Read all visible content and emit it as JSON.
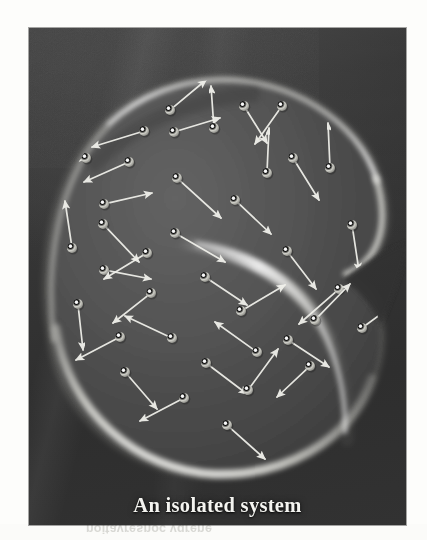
{
  "figure": {
    "caption": "An isolated system",
    "panel": {
      "background_color": "#383838",
      "border_color": "#1d1d1d",
      "page_color": "#fdfdfb"
    },
    "blob": {
      "label": "isolated-system-boundary",
      "shape": "kidney-bean",
      "fill_color": "#4f4f4f",
      "rim_light_color": "#e9e9e4",
      "description": "A large rounded kidney-bean shaped container with a glowing rim and an internal fold on the right side"
    },
    "particles": {
      "label": "gas-molecules",
      "color": "#e2e2dc",
      "count": 38,
      "arrow_color": "#f0f0ea",
      "arrow_label": "velocity-vector"
    },
    "bleed_text": "noitavresnoc ygrene"
  },
  "chart_data": {
    "type": "scatter",
    "title": "An isolated system",
    "xlabel": "",
    "ylabel": "",
    "xlim": [
      0,
      377
    ],
    "ylim": [
      0,
      497
    ],
    "grid": false,
    "legend": null,
    "annotations": [
      "An isolated system"
    ],
    "series": [
      {
        "name": "gas-molecules",
        "marker": "sphere",
        "color": "#e2e2dc",
        "points": [
          {
            "x": 141,
            "y": 82,
            "vx": 36,
            "vy": -30
          },
          {
            "x": 145,
            "y": 104,
            "vx": 46,
            "vy": -14
          },
          {
            "x": 115,
            "y": 103,
            "vx": -52,
            "vy": 16
          },
          {
            "x": 185,
            "y": 100,
            "vx": -3,
            "vy": -42
          },
          {
            "x": 215,
            "y": 78,
            "vx": 23,
            "vy": 37
          },
          {
            "x": 238,
            "y": 145,
            "vx": 2,
            "vy": -45
          },
          {
            "x": 264,
            "y": 130,
            "vx": 26,
            "vy": 42
          },
          {
            "x": 100,
            "y": 134,
            "vx": -45,
            "vy": 20
          },
          {
            "x": 75,
            "y": 176,
            "vx": 48,
            "vy": -11
          },
          {
            "x": 74,
            "y": 196,
            "vx": 36,
            "vy": 38
          },
          {
            "x": 148,
            "y": 150,
            "vx": 44,
            "vy": 40
          },
          {
            "x": 43,
            "y": 220,
            "vx": -7,
            "vy": -47
          },
          {
            "x": 146,
            "y": 205,
            "vx": 50,
            "vy": 29
          },
          {
            "x": 75,
            "y": 242,
            "vx": 47,
            "vy": 9
          },
          {
            "x": 258,
            "y": 223,
            "vx": 29,
            "vy": 38
          },
          {
            "x": 122,
            "y": 265,
            "vx": -38,
            "vy": 30
          },
          {
            "x": 176,
            "y": 249,
            "vx": 42,
            "vy": 28
          },
          {
            "x": 49,
            "y": 276,
            "vx": 5,
            "vy": 46
          },
          {
            "x": 212,
            "y": 283,
            "vx": 44,
            "vy": -26
          },
          {
            "x": 143,
            "y": 310,
            "vx": -47,
            "vy": -22
          },
          {
            "x": 91,
            "y": 309,
            "vx": -44,
            "vy": 23
          },
          {
            "x": 310,
            "y": 261,
            "vx": -40,
            "vy": 35
          },
          {
            "x": 323,
            "y": 197,
            "vx": 7,
            "vy": 46
          },
          {
            "x": 301,
            "y": 140,
            "vx": -2,
            "vy": -45
          },
          {
            "x": 228,
            "y": 324,
            "vx": -42,
            "vy": -30
          },
          {
            "x": 259,
            "y": 312,
            "vx": 41,
            "vy": 27
          },
          {
            "x": 177,
            "y": 335,
            "vx": 41,
            "vy": 31
          },
          {
            "x": 219,
            "y": 362,
            "vx": 30,
            "vy": -41
          },
          {
            "x": 155,
            "y": 370,
            "vx": -44,
            "vy": 23
          },
          {
            "x": 198,
            "y": 397,
            "vx": 38,
            "vy": 34
          },
          {
            "x": 118,
            "y": 225,
            "vx": -43,
            "vy": 26
          },
          {
            "x": 286,
            "y": 292,
            "vx": 35,
            "vy": -36
          },
          {
            "x": 96,
            "y": 344,
            "vx": 32,
            "vy": 37
          },
          {
            "x": 253,
            "y": 78,
            "vx": -27,
            "vy": 38
          },
          {
            "x": 281,
            "y": 338,
            "vx": -33,
            "vy": 31
          },
          {
            "x": 57,
            "y": 130,
            "vx": -46,
            "vy": 19
          },
          {
            "x": 206,
            "y": 172,
            "vx": 36,
            "vy": 34
          },
          {
            "x": 333,
            "y": 300,
            "vx": 38,
            "vy": -28
          }
        ]
      }
    ]
  }
}
